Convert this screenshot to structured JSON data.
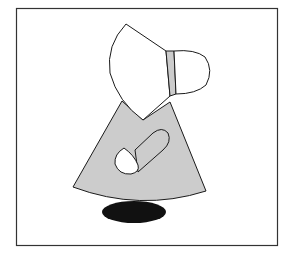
{
  "illustration": {
    "subject": "sunbonnet-figure",
    "colors": {
      "background": "#ffffff",
      "frame": "#333333",
      "outline": "#1a1a1a",
      "bonnet": "#ffffff",
      "bonnet_band": "#cccccc",
      "dress": "#cccccc",
      "hand": "#ffffff",
      "shoe": "#111111"
    }
  }
}
